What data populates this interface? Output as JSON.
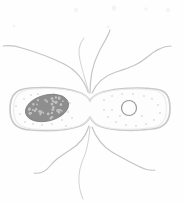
{
  "figure": {
    "style": "hand-drawn pencil line sketch",
    "background_color": "#fefefe",
    "canvas": {
      "width": 184,
      "height": 203
    }
  },
  "colors": {
    "outline": "#c9c9c9",
    "outline_inner": "#eaeaea",
    "flagellum": "#c4c4c4",
    "flagellum_faint": "#d5d5d5",
    "nucleoid_fill": "#8e8e8e",
    "nucleoid_speckle": "#c2c2c2",
    "plasmid_stroke": "#9a9a9a",
    "ribosome_dot": "#dcdcdc",
    "background": "#fefefe"
  },
  "cell": {
    "name": "bacterium-cell-body",
    "shape": "two rounded rod lobes joined at a pinched division furrow",
    "left_end_x": 10,
    "right_end_x": 170,
    "top_y": 88,
    "bottom_y": 130,
    "furrow_x": 90,
    "furrow_top_y": 100,
    "furrow_bottom_y": 118,
    "outline_path": "M 10,109 C 10,95 16,89 30,88 C 48,87 66,88 78,92 C 84,94 88,97 90,101 C 92,97 96,94 103,92 C 116,88 140,87 155,89 C 166,90 170,96 170,109 C 170,122 164,128 152,129 C 136,131 114,131 102,127 C 95,125 92,121 90,117 C 88,121 84,125 77,127 C 64,131 44,131 30,130 C 16,129 10,123 10,109 Z"
  },
  "nucleoid": {
    "name": "nucleoid",
    "label": "nucleoid (chromosome)",
    "center_x": 47,
    "center_y": 108,
    "radius_x": 22,
    "radius_y": 13,
    "rotation_deg": -14,
    "speckle_count": 42
  },
  "plasmid": {
    "name": "plasmid-ring",
    "label": "plasmid",
    "center_x": 129,
    "center_y": 108,
    "radius": 7.5
  },
  "ribosomes": {
    "name": "cytoplasm-stipple",
    "label": "ribosomes / cytoplasmic stipple",
    "count": 34,
    "left_lobe_points": [
      [
        24,
        99
      ],
      [
        31,
        95
      ],
      [
        20,
        114
      ],
      [
        25,
        122
      ],
      [
        33,
        124
      ],
      [
        42,
        125
      ],
      [
        52,
        124
      ],
      [
        62,
        120
      ],
      [
        68,
        112
      ],
      [
        70,
        103
      ],
      [
        62,
        96
      ],
      [
        54,
        94
      ],
      [
        72,
        118
      ],
      [
        16,
        106
      ],
      [
        38,
        94
      ],
      [
        66,
        126
      ]
    ],
    "right_lobe_points": [
      [
        104,
        100
      ],
      [
        112,
        96
      ],
      [
        122,
        94
      ],
      [
        133,
        94
      ],
      [
        144,
        96
      ],
      [
        152,
        99
      ],
      [
        158,
        105
      ],
      [
        160,
        113
      ],
      [
        154,
        120
      ],
      [
        146,
        124
      ],
      [
        136,
        126
      ],
      [
        126,
        125
      ],
      [
        116,
        122
      ],
      [
        108,
        117
      ],
      [
        104,
        110
      ],
      [
        112,
        110
      ],
      [
        120,
        116
      ],
      [
        142,
        116
      ]
    ]
  },
  "flagella": {
    "name": "flagella-group",
    "label": "peritrichous flagella",
    "total_count": 7,
    "upper_count": 4,
    "lower_count": 3,
    "insertion_top": {
      "x": 90,
      "y": 92
    },
    "insertion_bottom": {
      "x": 90,
      "y": 126
    },
    "upper": [
      {
        "name": "flagellum-top-left-long",
        "path": "M 88,92 C 84,80 76,70 64,64 C 52,58 36,52 22,48 C 16,46 9,45 3,46"
      },
      {
        "name": "flagellum-top-left-inner",
        "path": "M 89,93 C 86,82 82,70 80,60 C 78,52 79,44 84,38"
      },
      {
        "name": "flagellum-top-center-arc",
        "path": "M 90,93 C 90,80 92,66 98,54 C 102,45 108,37 110,30"
      },
      {
        "name": "flagellum-top-right-wavy",
        "path": "M 92,93 C 96,84 104,76 116,72 C 128,68 138,65 146,58 C 154,51 162,46 171,46"
      }
    ],
    "lower": [
      {
        "name": "flagellum-bottom-left",
        "path": "M 89,126 C 86,136 80,144 70,150 C 62,155 54,160 50,166 C 46,171 40,174 34,173"
      },
      {
        "name": "flagellum-bottom-center",
        "path": "M 90,127 C 89,140 87,152 82,162 C 79,170 78,180 80,190 C 81,194 82,197 83,199"
      },
      {
        "name": "flagellum-bottom-right",
        "path": "M 92,127 C 96,138 102,146 112,152 C 122,158 130,162 138,166 C 144,169 150,171 155,170"
      }
    ]
  }
}
